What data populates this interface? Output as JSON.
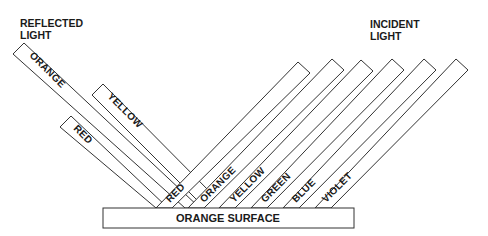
{
  "headings": {
    "reflected": [
      "REFLECTED",
      "LIGHT"
    ],
    "incident": [
      "INCIDENT",
      "LIGHT"
    ]
  },
  "surface": {
    "label": "ORANGE SURFACE"
  },
  "reflected_beams": [
    {
      "label": "ORANGE"
    },
    {
      "label": "YELLOW"
    },
    {
      "label": "RED"
    }
  ],
  "incident_beams": [
    {
      "label": "RED"
    },
    {
      "label": "ORANGE"
    },
    {
      "label": "YELLOW"
    },
    {
      "label": "GREEN"
    },
    {
      "label": "BLUE"
    },
    {
      "label": "VIOLET"
    }
  ],
  "colors": {
    "stroke": "#333333",
    "text": "#1a1a1a",
    "background": "#ffffff"
  }
}
